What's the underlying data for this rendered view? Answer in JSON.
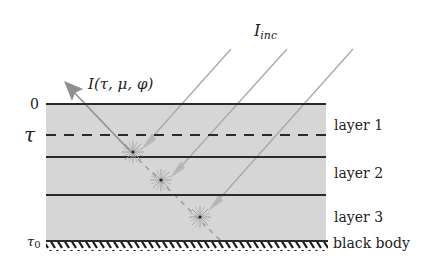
{
  "diagram": {
    "type": "radiative-transfer-layered-slab",
    "labels": {
      "incident": "I",
      "incident_sub": "inc",
      "outgoing": "I(τ, μ, φ)",
      "tau_top": "0",
      "tau_level": "τ",
      "tau_bottom": "τ",
      "tau_bottom_sub": "0",
      "bottom_boundary": "black body"
    },
    "layers": [
      {
        "label": "layer 1"
      },
      {
        "label": "layer 2"
      },
      {
        "label": "layer 3"
      }
    ],
    "colors": {
      "slab_fill": "#d6d6d6",
      "boundary_line": "#2a2a2a",
      "ray": "#a8a8a8",
      "outgoing_arrow": "#8f8f8f",
      "star": "#9a9a9a"
    }
  }
}
